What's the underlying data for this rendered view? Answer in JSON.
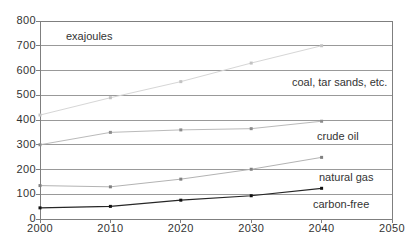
{
  "chart_data": {
    "type": "line",
    "title": "",
    "unit_label": "exajoules",
    "xlabel": "",
    "ylabel": "exajoules",
    "x": [
      2000,
      2010,
      2020,
      2030,
      2040
    ],
    "x_axis": {
      "min": 2000,
      "max": 2050,
      "ticks": [
        2000,
        2010,
        2020,
        2030,
        2040,
        2050
      ]
    },
    "y_axis": {
      "min": 0,
      "max": 800,
      "ticks": [
        0,
        100,
        200,
        300,
        400,
        500,
        600,
        700,
        800
      ]
    },
    "grid": "horizontal-gridlines",
    "legend": "inline-series-labels",
    "series": [
      {
        "name": "coal, tar sands, etc.",
        "values": [
          420,
          490,
          555,
          630,
          700
        ],
        "line_color": "#d6d6d6",
        "marker_color": "#c2c2c2",
        "line_width": 1
      },
      {
        "name": "crude oil",
        "values": [
          300,
          350,
          360,
          365,
          395
        ],
        "line_color": "#bababa",
        "marker_color": "#8c8c8c",
        "line_width": 1
      },
      {
        "name": "natural gas",
        "values": [
          135,
          130,
          161,
          201,
          249
        ],
        "line_color": "#b3b3b3",
        "marker_color": "#808080",
        "line_width": 1
      },
      {
        "name": "carbon-free",
        "values": [
          45,
          51,
          76,
          94,
          124
        ],
        "line_color": "#262626",
        "marker_color": "#111111",
        "line_width": 1.2
      }
    ],
    "colors": {
      "grid": "#999999",
      "axis": "#7f7f7f",
      "text": "#333333",
      "background": "#ffffff"
    }
  }
}
